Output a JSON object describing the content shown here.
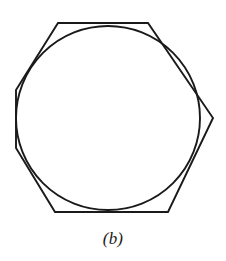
{
  "figure": {
    "caption": "(b)",
    "label_letter": "b",
    "background_color": "#ffffff",
    "stroke_color": "#1a1a1a",
    "circle": {
      "name": "inscribed-circle",
      "center_x": 108,
      "center_y": 118,
      "radius": 92,
      "stroke_width": 1.9,
      "fill": "none"
    },
    "polygon": {
      "name": "circumscribed-polygon",
      "sides": 7,
      "stroke_width": 1.9,
      "fill": "none",
      "points_attr": "58,23 148,23 213,118 168,212 55,212 16,148 16,90",
      "vertices": [
        {
          "label": "top-left",
          "x": 58,
          "y": 23
        },
        {
          "label": "top-right",
          "x": 148,
          "y": 23
        },
        {
          "label": "right",
          "x": 213,
          "y": 118
        },
        {
          "label": "bottom-right",
          "x": 168,
          "y": 212
        },
        {
          "label": "bottom-left",
          "x": 55,
          "y": 212
        },
        {
          "label": "left-lower",
          "x": 16,
          "y": 148
        },
        {
          "label": "left-upper",
          "x": 16,
          "y": 90
        }
      ]
    }
  },
  "chart_data": {
    "type": "diagram",
    "title": "(b)",
    "shapes": [
      {
        "kind": "circle",
        "center": [
          108,
          118
        ],
        "radius": 92
      },
      {
        "kind": "polygon",
        "n_vertices": 7,
        "vertices": [
          [
            58,
            23
          ],
          [
            148,
            23
          ],
          [
            213,
            118
          ],
          [
            168,
            212
          ],
          [
            55,
            212
          ],
          [
            16,
            148
          ],
          [
            16,
            90
          ]
        ]
      }
    ],
    "xlabel": "",
    "ylabel": "",
    "grid": false,
    "legend": false
  }
}
